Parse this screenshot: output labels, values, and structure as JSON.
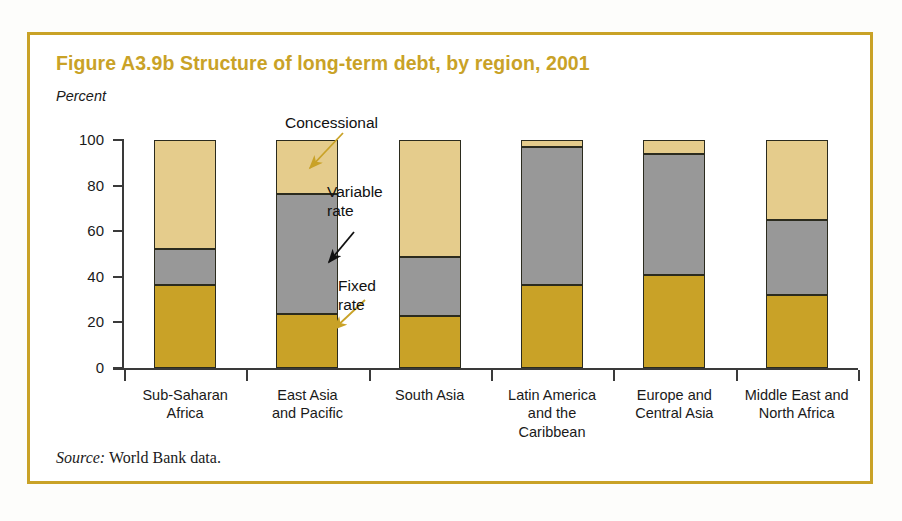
{
  "figure": {
    "title": "Figure A3.9b  Structure of long-term debt, by region, 2001",
    "y_axis_label": "Percent",
    "source_word": "Source:",
    "source_text": " World Bank data.",
    "frame_color": "#c9a227",
    "title_color": "#c9a227"
  },
  "annotations": [
    {
      "name": "concessional",
      "label": "Concessional",
      "arrow_color": "#c9a227"
    },
    {
      "name": "variable",
      "label": "Variable\nrate",
      "arrow_color": "#111111"
    },
    {
      "name": "fixed",
      "label": "Fixed\nrate",
      "arrow_color": "#c9a227"
    }
  ],
  "chart_data": {
    "type": "bar",
    "stacked": true,
    "title": "Figure A3.9b  Structure of long-term debt, by region, 2001",
    "xlabel": "",
    "ylabel": "Percent",
    "ylim": [
      0,
      100
    ],
    "yticks": [
      0,
      20,
      40,
      60,
      80,
      100
    ],
    "ytick_labels": [
      "0",
      "20",
      "40",
      "60",
      "80",
      "100"
    ],
    "grid": false,
    "legend": "none (inline annotations with arrows)",
    "categories": [
      "Sub-Saharan\nAfrica",
      "East Asia\nand Pacific",
      "South Asia",
      "Latin America\nand the\nCaribbean",
      "Europe and\nCentral Asia",
      "Middle East and\nNorth Africa"
    ],
    "series": [
      {
        "name": "Fixed rate",
        "color": "#c9a227",
        "values": [
          36.5,
          23.5,
          23.0,
          36.5,
          41.0,
          32.0
        ]
      },
      {
        "name": "Variable rate",
        "color": "#989898",
        "values": [
          15.5,
          53.0,
          25.5,
          60.5,
          53.0,
          33.0
        ]
      },
      {
        "name": "Concessional",
        "color": "#e5cc8c",
        "values": [
          48.0,
          23.5,
          51.5,
          3.0,
          6.0,
          35.0
        ]
      }
    ],
    "totals": [
      100,
      100,
      100,
      100,
      100,
      100
    ],
    "source": "Source: World Bank data."
  }
}
